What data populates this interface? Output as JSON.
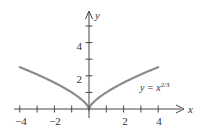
{
  "chart_data": {
    "type": "line",
    "title": "",
    "xlabel": "x",
    "ylabel": "y",
    "xlim": [
      -4,
      4.5
    ],
    "ylim": [
      0,
      5.8
    ],
    "x_ticks": [
      -4,
      -3,
      -2,
      -1,
      1,
      2,
      3,
      4
    ],
    "x_tick_labels": [
      "-4",
      "-2",
      "2",
      "4"
    ],
    "y_ticks": [
      1,
      2,
      3,
      4,
      5
    ],
    "y_tick_labels": [
      "2",
      "4"
    ],
    "grid": false,
    "legend": null,
    "series": [
      {
        "name": "y = x^(2/3)",
        "function": "x^(2/3)",
        "x": [
          -4,
          -3,
          -2,
          -1,
          -0.5,
          0,
          0.5,
          1,
          2,
          3,
          4
        ],
        "y": [
          2.52,
          2.08,
          1.59,
          1.0,
          0.63,
          0,
          0.63,
          1.0,
          1.59,
          2.08,
          2.52
        ]
      }
    ],
    "annotations": [
      {
        "text": "y = x^(2/3)",
        "x": 2.6,
        "y": 1.4
      }
    ],
    "colors": {
      "curve": "#8c8c8c",
      "axis": "#444444"
    }
  },
  "labels": {
    "x_axis": "x",
    "y_axis": "y",
    "xt_m4": "−4",
    "xt_m2": "−2",
    "xt_2": "2",
    "xt_4": "4",
    "yt_2": "2",
    "yt_4": "4",
    "curve_label_base": "y = x",
    "curve_label_exp": "2/3"
  }
}
